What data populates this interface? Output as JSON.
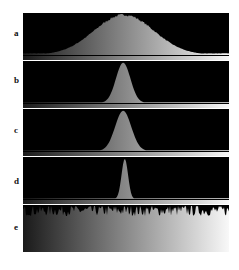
{
  "chart_data": [
    {
      "type": "area",
      "panel": "a",
      "title": "",
      "xlabel": "",
      "ylabel": "",
      "x_range": [
        0,
        255
      ],
      "distribution": "gaussian",
      "center": 125,
      "sigma": 37,
      "peak_fraction": 0.98,
      "noise": 0.03,
      "baseline_fraction": 0.04
    },
    {
      "type": "area",
      "panel": "b",
      "x_range": [
        0,
        255
      ],
      "distribution": "gaussian",
      "center": 124,
      "sigma": 9,
      "peak_fraction": 0.98,
      "noise": 0.0,
      "baseline_fraction": 0.02
    },
    {
      "type": "area",
      "panel": "c",
      "x_range": [
        0,
        255
      ],
      "distribution": "gaussian",
      "center": 124,
      "sigma": 10,
      "peak_fraction": 0.98,
      "noise": 0.0,
      "baseline_fraction": 0.02
    },
    {
      "type": "area",
      "panel": "d",
      "x_range": [
        0,
        255
      ],
      "distribution": "gaussian",
      "center": 126,
      "sigma": 4,
      "peak_fraction": 0.98,
      "noise": 0.0,
      "baseline_fraction": 0.02
    },
    {
      "type": "area",
      "panel": "e",
      "x_range": [
        0,
        255
      ],
      "distribution": "uniform",
      "center": null,
      "sigma": null,
      "peak_fraction": 0.9,
      "noise": 0.12,
      "baseline_fraction": 0.9
    }
  ],
  "labels": [
    "a",
    "b",
    "c",
    "d",
    "e"
  ],
  "colors": {
    "panel_bg": "#000000",
    "fill_dark": "#2a2a2a",
    "fill_light": "#f4f4f4",
    "separator": "#ffffff"
  }
}
